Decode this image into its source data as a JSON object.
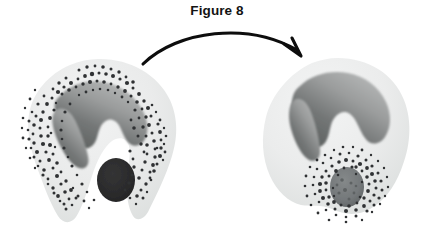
{
  "figure": {
    "title": "Figure 8",
    "domain": "cell-biology-illustration",
    "background_color": "#ffffff",
    "width": 434,
    "height": 234
  },
  "palette": {
    "cytoplasm_light": "#eceded",
    "cytoplasm_mid": "#e2e4e3",
    "cytoplasm_edge": "#d4d7d6",
    "nucleus_dark": "#6a6c6b",
    "nucleus_mid": "#808283",
    "nucleus_light": "#a7a9a9",
    "granule_color": "#2f3133",
    "particle_external": "#2b2b2c",
    "phagosome_fill": "#75797a",
    "phagosome_edge": "#5d6162",
    "arrow_color": "#0d0d0d",
    "title_color": "#131313"
  },
  "arrow": {
    "name": "transition-arrow",
    "label": "",
    "from": {
      "x": 143,
      "y": 64
    },
    "to": {
      "x": 301,
      "y": 55
    },
    "curve_control": {
      "x": 220,
      "y": 22
    },
    "stroke_width": 3.1,
    "head_length": 17
  },
  "cells": [
    {
      "id": "cell-before",
      "stage_label": "",
      "stage_order": 1,
      "center": {
        "x": 100,
        "y": 138
      },
      "description": "granulocyte with C-shaped pseudopods engulfing an external dark particle; granules dense in peripheral cytoplasm",
      "nucleus": {
        "name": "nucleus",
        "shape": "horseshoe / multilobed",
        "center": {
          "x": 96,
          "y": 126
        }
      },
      "particle": {
        "name": "target-particle",
        "state": "external",
        "center": {
          "x": 116,
          "y": 180
        },
        "radius_x": 19,
        "radius_y": 22,
        "fill": "#2b2b2c"
      },
      "granules": {
        "name": "cytoplasmic-granules",
        "count": 470,
        "distribution": "peripheral band around nucleus",
        "size_px": [
          1.2,
          3.0
        ]
      },
      "pseudopods": 2
    },
    {
      "id": "cell-after",
      "stage_label": "",
      "stage_order": 2,
      "center": {
        "x": 340,
        "y": 140
      },
      "description": "rounded granulocyte after internalization; particle enclosed in a phagosome with granules fused around it",
      "nucleus": {
        "name": "nucleus",
        "shape": "horseshoe / multilobed",
        "center": {
          "x": 337,
          "y": 113
        }
      },
      "particle": {
        "name": "target-particle",
        "state": "internalized-in-phagosome",
        "center": {
          "x": 347,
          "y": 187
        },
        "radius_x": 17,
        "radius_y": 20,
        "fill": "#75797a"
      },
      "granules": {
        "name": "cytoplasmic-granules",
        "count": 150,
        "distribution": "clustered as a halo around the phagosome",
        "size_px": [
          1.2,
          3.2
        ]
      },
      "pseudopods": 0
    }
  ]
}
